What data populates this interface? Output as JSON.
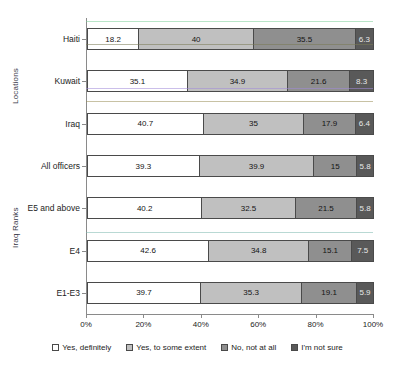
{
  "chart_data": {
    "type": "bar",
    "orientation": "horizontal",
    "stacked": true,
    "stack_mode": "percent",
    "title": "",
    "xlabel": "",
    "ylabel": "",
    "xlim": [
      0,
      100
    ],
    "xticks": [
      "0%",
      "20%",
      "40%",
      "60%",
      "80%",
      "100%"
    ],
    "xtick_values": [
      0,
      20,
      40,
      60,
      80,
      100
    ],
    "grid": false,
    "legend_position": "bottom",
    "categories": [
      "Haiti",
      "Kuwait",
      "Iraq",
      "All officers",
      "E5 and above",
      "E4",
      "E1-E3"
    ],
    "category_groups": [
      {
        "label": "Locations",
        "categories": [
          "Haiti",
          "Kuwait",
          "Iraq"
        ]
      },
      {
        "label": "Iraq Ranks",
        "categories": [
          "All officers",
          "E5 and above",
          "E4",
          "E1-E3"
        ]
      }
    ],
    "series": [
      {
        "name": "Yes, definitely",
        "color": "#ffffff",
        "values": [
          18.2,
          35.1,
          40.7,
          39.3,
          40.2,
          42.6,
          39.7
        ]
      },
      {
        "name": "Yes, to some extent",
        "color": "#c0c0c0",
        "values": [
          40,
          34.9,
          35,
          39.9,
          32.5,
          34.8,
          35.3
        ]
      },
      {
        "name": "No, not at all",
        "color": "#8f8f8f",
        "values": [
          35.5,
          21.6,
          17.9,
          15,
          21.5,
          15.1,
          19.1
        ]
      },
      {
        "name": "I'm not sure",
        "color": "#595959",
        "values": [
          6.3,
          8.3,
          6.4,
          5.8,
          5.8,
          7.5,
          5.9
        ]
      }
    ],
    "rows": [
      {
        "category": "Haiti",
        "group": "Locations",
        "values": [
          18.2,
          40,
          35.5,
          6.3
        ]
      },
      {
        "category": "Kuwait",
        "group": "Locations",
        "values": [
          35.1,
          34.9,
          21.6,
          8.3
        ]
      },
      {
        "category": "Iraq",
        "group": "Locations",
        "values": [
          40.7,
          35,
          17.9,
          6.4
        ]
      },
      {
        "category": "All officers",
        "group": "Iraq Ranks",
        "values": [
          39.3,
          39.9,
          15,
          5.8
        ]
      },
      {
        "category": "E5 and above",
        "group": "Iraq Ranks",
        "values": [
          40.2,
          32.5,
          21.5,
          5.8
        ]
      },
      {
        "category": "E4",
        "group": "Iraq Ranks",
        "values": [
          42.6,
          34.8,
          15.1,
          7.5
        ]
      },
      {
        "category": "E1-E3",
        "group": "Iraq Ranks",
        "values": [
          39.7,
          35.3,
          19.1,
          5.9
        ]
      }
    ],
    "legend": [
      "Yes, definitely",
      "Yes, to some extent",
      "No, not at all",
      "I'm not sure"
    ]
  }
}
